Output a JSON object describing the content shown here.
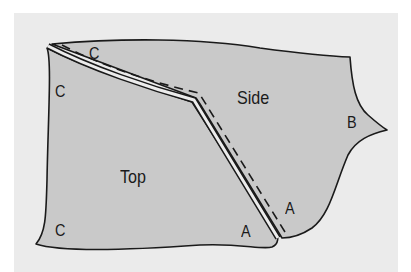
{
  "diagram": {
    "colors": {
      "panel": "#ebebeb",
      "piece_fill": "#c9c9c9",
      "outline": "#1a1a1a",
      "seam_gap": "#ececec"
    },
    "pieces": [
      {
        "id": "side",
        "label": "Side"
      },
      {
        "id": "top",
        "label": "Top"
      }
    ],
    "labels": {
      "side": "Side",
      "top": "Top",
      "c_top_edge": "C",
      "c_left_upper": "C",
      "c_left_lower": "C",
      "b_right": "B",
      "a_side": "A",
      "a_top": "A"
    },
    "seam": {
      "type": "double-line with dashed stitch line",
      "joins": [
        "Top",
        "Side"
      ]
    }
  }
}
